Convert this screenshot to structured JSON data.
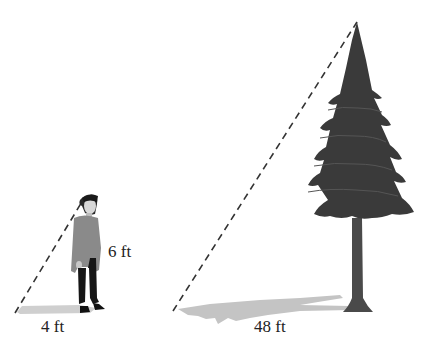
{
  "diagram": {
    "type": "similar-triangles-shadow",
    "person": {
      "height_label": "6 ft",
      "shadow_label": "4 ft"
    },
    "tree": {
      "shadow_label": "48 ft"
    },
    "colors": {
      "tree": "#3a3a3a",
      "trunk": "#4a4a4a",
      "shadow": "#c8c8c8",
      "dashed_line": "#333333",
      "shirt": "#8a8a8a",
      "pants": "#1a1a1a"
    }
  }
}
